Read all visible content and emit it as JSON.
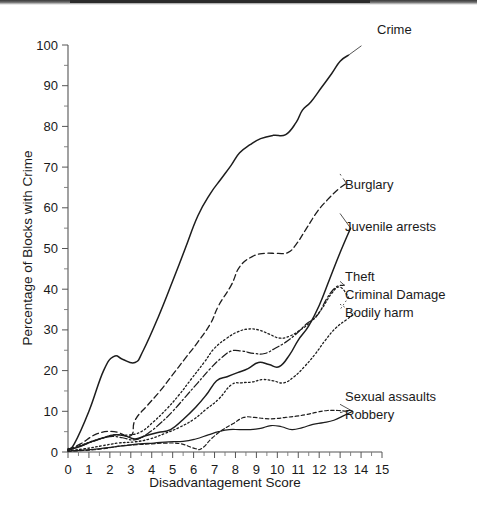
{
  "chart_data": {
    "type": "line",
    "title": "",
    "xlabel": "Disadvantagement Score",
    "ylabel": "Percentage of Blocks with Crime",
    "xlim": [
      0,
      15
    ],
    "ylim": [
      0,
      100
    ],
    "xticks": [
      "0",
      "1",
      "2",
      "3",
      "4",
      "5",
      "6",
      "7",
      "8",
      "9",
      "10",
      "11",
      "12",
      "13",
      "14",
      "15"
    ],
    "yticks": [
      "0",
      "10",
      "20",
      "30",
      "40",
      "50",
      "60",
      "70",
      "80",
      "90",
      "100"
    ],
    "grid": false,
    "legend_position": "right-inline-labels",
    "series": [
      {
        "name": "Crime",
        "style": "solid",
        "label": "Crime",
        "x": [
          0,
          0.3,
          1.0,
          1.7,
          2.2,
          2.6,
          3.2,
          3.6,
          4.3,
          5.0,
          5.6,
          6.2,
          6.8,
          7.3,
          7.8,
          8.2,
          8.7,
          9.2,
          9.8,
          10.4,
          10.9,
          11.2,
          11.6,
          12.1,
          12.6,
          13.0,
          13.4
        ],
        "y": [
          0.8,
          2.0,
          10.0,
          20.0,
          23.5,
          22.8,
          22.0,
          25.0,
          33.0,
          42.0,
          50.0,
          58.0,
          63.5,
          67.0,
          70.5,
          73.5,
          75.5,
          77.0,
          77.8,
          78.0,
          81.0,
          84.0,
          86.0,
          89.5,
          93.0,
          96.0,
          97.5
        ]
      },
      {
        "name": "Burglary",
        "style": "dashed",
        "label": "Burglary",
        "x": [
          0,
          0.6,
          1.4,
          2.2,
          3.0,
          3.2,
          3.8,
          4.4,
          5.0,
          5.6,
          6.2,
          6.8,
          7.2,
          7.8,
          8.2,
          8.8,
          9.4,
          10.0,
          10.5,
          10.9,
          11.4,
          11.9,
          12.4,
          12.9,
          13.3
        ],
        "y": [
          0.6,
          2.0,
          4.5,
          5.0,
          4.0,
          7.8,
          11.5,
          15.0,
          19.0,
          23.0,
          27.0,
          31.5,
          36.0,
          41.0,
          45.5,
          48.0,
          48.8,
          48.8,
          49.0,
          51.0,
          55.0,
          59.0,
          62.0,
          64.5,
          66.0
        ]
      },
      {
        "name": "Juvenile arrests",
        "style": "solid",
        "label": "Juvenile arrests",
        "x": [
          0,
          0.5,
          1.1,
          1.7,
          2.2,
          2.7,
          3.2,
          3.7,
          4.3,
          4.9,
          5.5,
          6.1,
          6.6,
          7.1,
          7.6,
          8.1,
          8.6,
          9.1,
          9.6,
          10.1,
          10.6,
          11.0,
          11.5,
          12.0,
          12.5,
          13.0,
          13.5
        ],
        "y": [
          0.5,
          1.2,
          2.5,
          3.5,
          4.2,
          4.0,
          3.2,
          4.0,
          4.8,
          5.5,
          8.0,
          11.0,
          14.0,
          17.5,
          18.5,
          19.5,
          20.5,
          22.0,
          21.5,
          21.0,
          24.0,
          27.5,
          31.0,
          36.0,
          42.5,
          49.0,
          55.0
        ]
      },
      {
        "name": "Theft",
        "style": "dashdot",
        "label": "Theft",
        "x": [
          0,
          0.6,
          1.3,
          2.0,
          2.6,
          3.2,
          3.8,
          4.4,
          5.0,
          5.6,
          6.2,
          6.8,
          7.3,
          7.8,
          8.3,
          8.9,
          9.4,
          9.9,
          10.4,
          10.9,
          11.4,
          11.9,
          12.4,
          12.8,
          13.2
        ],
        "y": [
          0.5,
          1.5,
          2.8,
          3.8,
          3.5,
          3.0,
          4.5,
          7.0,
          10.0,
          13.5,
          17.0,
          20.5,
          23.0,
          24.8,
          24.8,
          24.2,
          24.2,
          25.5,
          27.0,
          29.0,
          31.5,
          33.5,
          38.0,
          40.5,
          41.0
        ]
      },
      {
        "name": "Criminal Damage",
        "style": "dotted",
        "label": "Criminal Damage",
        "x": [
          0,
          0.7,
          1.5,
          2.2,
          2.9,
          3.5,
          4.1,
          4.7,
          5.3,
          5.9,
          6.5,
          7.0,
          7.6,
          8.1,
          8.6,
          9.1,
          9.6,
          10.1,
          10.6,
          11.1,
          11.6,
          12.1,
          12.6,
          13.0,
          13.4
        ],
        "y": [
          0.5,
          1.8,
          3.2,
          4.2,
          4.2,
          5.0,
          7.5,
          10.5,
          14.0,
          18.0,
          22.0,
          25.5,
          28.0,
          29.5,
          30.2,
          30.0,
          29.0,
          28.0,
          28.5,
          30.0,
          32.0,
          35.0,
          39.0,
          40.5,
          38.0
        ]
      },
      {
        "name": "Bodily harm",
        "style": "dotted",
        "label": "Bodily harm",
        "x": [
          0,
          0.8,
          1.6,
          2.4,
          3.2,
          3.9,
          4.6,
          5.3,
          6.0,
          6.6,
          7.2,
          7.8,
          8.3,
          8.8,
          9.3,
          9.8,
          10.3,
          10.8,
          11.3,
          11.8,
          12.3,
          12.8,
          13.3,
          13.7
        ],
        "y": [
          0.3,
          0.8,
          1.5,
          2.2,
          2.5,
          3.2,
          4.5,
          6.0,
          8.0,
          10.5,
          13.0,
          16.5,
          17.0,
          17.2,
          17.8,
          17.5,
          17.0,
          18.5,
          21.0,
          24.0,
          27.5,
          30.5,
          32.5,
          34.0
        ]
      },
      {
        "name": "Sexual assaults",
        "style": "dashed-fine",
        "label": "Sexual assaults",
        "x": [
          0,
          0.8,
          1.7,
          2.5,
          3.3,
          4.0,
          4.7,
          5.4,
          6.1,
          6.4,
          6.9,
          7.4,
          7.9,
          8.4,
          8.9,
          9.4,
          9.9,
          10.4,
          10.9,
          11.4,
          11.9,
          12.4,
          12.9,
          13.4
        ],
        "y": [
          0.2,
          0.4,
          0.8,
          1.5,
          1.8,
          2.0,
          2.2,
          2.0,
          0.8,
          0.9,
          3.5,
          5.5,
          7.0,
          8.5,
          8.5,
          8.2,
          8.2,
          8.5,
          8.8,
          9.2,
          9.8,
          10.2,
          10.2,
          10.0
        ]
      },
      {
        "name": "Robbery",
        "style": "solid-thin",
        "label": "Robbery",
        "x": [
          0,
          0.9,
          1.8,
          2.6,
          3.4,
          4.1,
          4.8,
          5.5,
          6.1,
          6.7,
          7.2,
          7.7,
          8.2,
          8.7,
          9.2,
          9.7,
          10.2,
          10.7,
          11.2,
          11.7,
          12.2,
          12.7,
          13.2,
          13.6
        ],
        "y": [
          0.2,
          0.5,
          1.0,
          1.5,
          2.0,
          2.2,
          2.5,
          2.6,
          3.2,
          4.2,
          5.0,
          5.5,
          5.5,
          5.5,
          5.8,
          6.5,
          6.2,
          5.5,
          6.0,
          6.8,
          7.2,
          7.8,
          9.0,
          10.0
        ]
      }
    ],
    "series_label_anchors": [
      {
        "name": "Crime",
        "label_x": 377,
        "label_y": 34
      },
      {
        "name": "Burglary",
        "label_x": 345,
        "label_y": 189
      },
      {
        "name": "Juvenile arrests",
        "label_x": 345,
        "label_y": 231
      },
      {
        "name": "Theft",
        "label_x": 345,
        "label_y": 281
      },
      {
        "name": "Criminal Damage",
        "label_x": 345,
        "label_y": 299
      },
      {
        "name": "Bodily harm",
        "label_x": 345,
        "label_y": 317
      },
      {
        "name": "Sexual assaults",
        "label_x": 345,
        "label_y": 401
      },
      {
        "name": "Robbery",
        "label_x": 345,
        "label_y": 419
      }
    ]
  }
}
